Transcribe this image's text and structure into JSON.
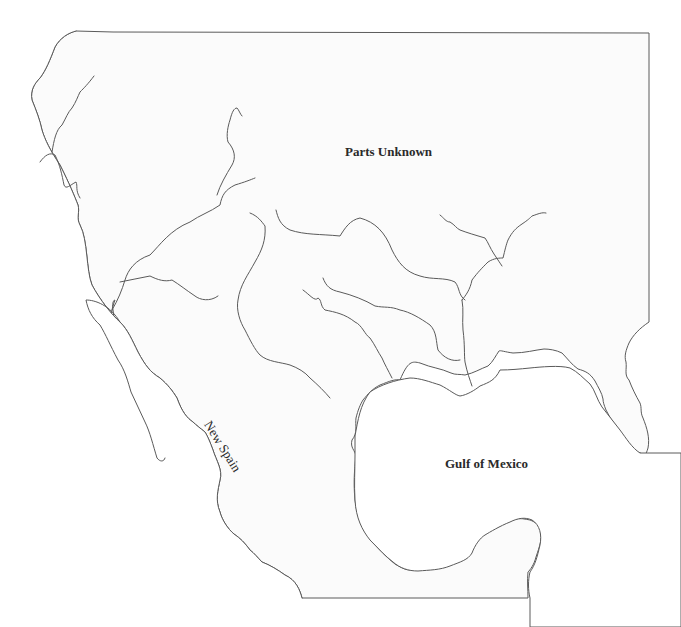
{
  "map": {
    "title": "Outline map of New Spain and the Gulf of Mexico",
    "labels": {
      "parts_unknown": "Parts Unknown",
      "new_spain": "New Spain",
      "gulf_of_mexico": "Gulf of Mexico"
    },
    "colors": {
      "land": "#fbfbfb",
      "water": "#ffffff",
      "outline": "#5a5a5a",
      "label": "#2a2a2a"
    }
  }
}
